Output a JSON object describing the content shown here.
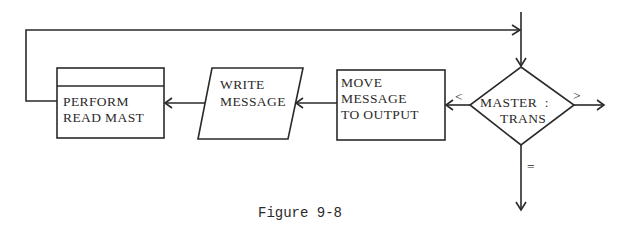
{
  "diagram": {
    "type": "flowchart",
    "nodes": {
      "perform": {
        "shape": "predefined-process",
        "lines": [
          "PERFORM",
          "READ MAST"
        ]
      },
      "write": {
        "shape": "parallelogram",
        "lines": [
          "WRITE",
          "MESSAGE"
        ]
      },
      "move": {
        "shape": "rectangle",
        "lines": [
          "MOVE",
          "MESSAGE",
          "TO OUTPUT"
        ]
      },
      "decision": {
        "shape": "diamond",
        "lines": [
          "MASTER  :",
          "TRANS"
        ]
      }
    },
    "edge_labels": {
      "less": "<",
      "greater": ">",
      "equal": "="
    },
    "edges": [
      {
        "from": "entry",
        "to": "decision"
      },
      {
        "from": "decision",
        "to": "move",
        "label": "<"
      },
      {
        "from": "decision",
        "to": "exit-right",
        "label": ">"
      },
      {
        "from": "decision",
        "to": "exit-down",
        "label": "="
      },
      {
        "from": "move",
        "to": "write"
      },
      {
        "from": "write",
        "to": "perform"
      },
      {
        "from": "perform",
        "to": "decision",
        "via": "loop-back"
      }
    ],
    "caption": "Figure 9-8"
  }
}
